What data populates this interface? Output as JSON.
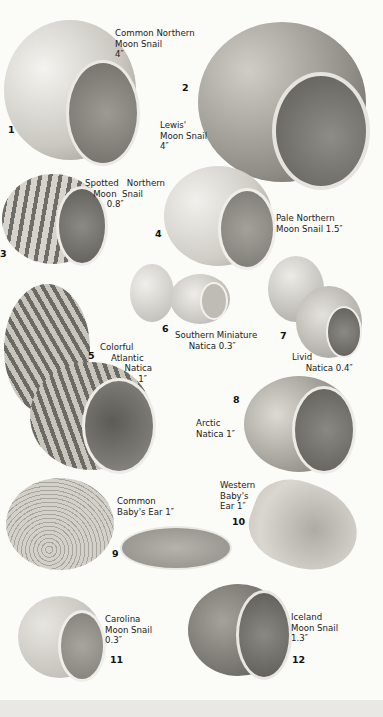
{
  "plate": {
    "title": "Moon Snails and Naticas",
    "species": [
      {
        "number": "1",
        "name": "Common Northern\nMoon Snail\n4″"
      },
      {
        "number": "2",
        "name": "Lewis'\nMoon Snail\n4″"
      },
      {
        "number": "3",
        "name": "Spotted   Northern\n   Moon  Snail\n        0.8″"
      },
      {
        "number": "4",
        "name": "Pale Northern\nMoon Snail 1.5″"
      },
      {
        "number": "5",
        "name": "Colorful\n    Atlantic\n         Natica\n              1″"
      },
      {
        "number": "6",
        "name": "Southern Miniature\n     Natica 0.3″"
      },
      {
        "number": "7",
        "name": "Livid\n     Natica 0.4″"
      },
      {
        "number": "8",
        "name": "Arctic\nNatica 1″"
      },
      {
        "number": "9",
        "name": "Common\nBaby's Ear 1″"
      },
      {
        "number": "10",
        "name": "Western\nBaby's\nEar 1″"
      },
      {
        "number": "11",
        "name": "Carolina\nMoon Snail\n0.3″"
      },
      {
        "number": "12",
        "name": "Iceland\nMoon Snail\n1.3″"
      }
    ]
  },
  "colors": {
    "background": "#fbfbf8",
    "shell_light": "#e3e1da",
    "shell_mid": "#a9a7a0",
    "shell_dark": "#6e6c66",
    "aperture": "#8d8b85"
  }
}
